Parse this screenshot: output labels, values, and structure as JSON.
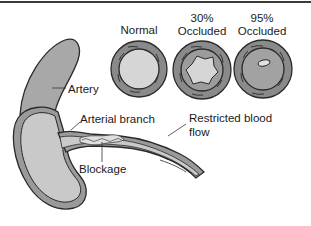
{
  "diagram": {
    "cross_sections": [
      {
        "id": "normal",
        "label_line1": "",
        "label_line2": "Normal"
      },
      {
        "id": "occluded-30",
        "label_line1": "30%",
        "label_line2": "Occluded"
      },
      {
        "id": "occluded-95",
        "label_line1": "95%",
        "label_line2": "Occluded"
      }
    ],
    "callouts": {
      "artery": "Artery",
      "arterial_branch": "Arterial branch",
      "blockage": "Blockage",
      "restricted_line1": "Restricted blood",
      "restricted_line2": "flow"
    },
    "colors": {
      "wall": "#8a8a8a",
      "lumen": "#d4d4d4",
      "outline": "#2a2a2a",
      "artery_fill": "#a9a9a9"
    }
  }
}
